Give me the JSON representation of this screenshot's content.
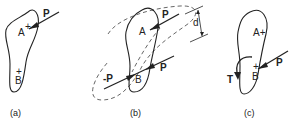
{
  "figure": {
    "panels": [
      {
        "id": "a",
        "caption": "(a)",
        "points": [
          "A",
          "B"
        ],
        "forces": [
          {
            "label": "P",
            "applied_at": "A"
          }
        ]
      },
      {
        "id": "b",
        "caption": "(b)",
        "points": [
          "A",
          "B"
        ],
        "forces": [
          {
            "label": "P",
            "applied_at": "A"
          },
          {
            "label": "P",
            "applied_at": "B"
          },
          {
            "label": "-P",
            "applied_at": "B"
          }
        ],
        "dimension": "d"
      },
      {
        "id": "c",
        "caption": "(c)",
        "points": [
          "A",
          "B"
        ],
        "forces": [
          {
            "label": "P",
            "applied_at": "B"
          }
        ],
        "moment": "T"
      }
    ]
  },
  "labels": {
    "a_P": "P",
    "a_A": "A",
    "a_B": "B",
    "a_cap": "(a)",
    "b_P1": "P",
    "b_P2": "P",
    "b_negP": "-P",
    "b_A": "A",
    "b_B": "B",
    "b_d": "d",
    "b_cap": "(b)",
    "c_P": "P",
    "c_A": "A+",
    "c_B": "B",
    "c_T": "T",
    "c_cap": "(c)"
  }
}
